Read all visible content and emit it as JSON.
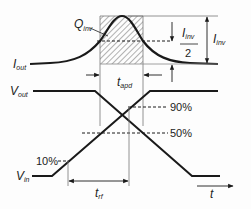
{
  "diagram": {
    "signals": {
      "iout": {
        "main": "I",
        "sub": "out"
      },
      "vout": {
        "main": "V",
        "sub": "out"
      },
      "vin": {
        "main": "V",
        "sub": "in"
      }
    },
    "annotations": {
      "qinv": {
        "main": "Q",
        "sub": "inv"
      },
      "iinv_half_num": {
        "main": "I",
        "sub": "inv"
      },
      "iinv_half_den": "2",
      "iinv": {
        "main": "I",
        "sub": "inv"
      },
      "tapd": {
        "main": "t",
        "sub": "apd"
      },
      "trf": {
        "main": "t",
        "sub": "rf"
      },
      "time_axis": "t"
    },
    "levels": {
      "p90": "90%",
      "p50": "50%",
      "p10": "10%"
    },
    "colors": {
      "stroke": "#1a1a1a",
      "hatch": "#555555",
      "background": "#fdfdfd"
    }
  }
}
